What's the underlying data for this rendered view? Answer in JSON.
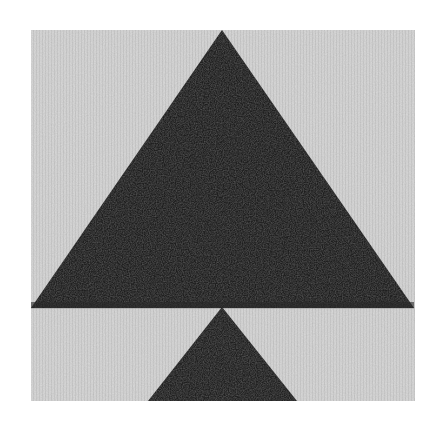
{
  "image": {
    "description": "Black-and-white photograph of a quilt block: a large dark fabric triangle on a light textured background, with a smaller dark triangle beneath it",
    "colors": {
      "page_background": "#ffffff",
      "fabric_light": "#d6d6d6",
      "fabric_light_speckle": "#b8b8b8",
      "fabric_dark": "#1e1e1e",
      "fabric_dark_speckle": "#3a3a3a"
    },
    "regions": {
      "fabric_panel": {
        "x": 31,
        "y": 30,
        "width": 384,
        "height": 371
      },
      "large_triangle": {
        "apex": [
          222,
          30
        ],
        "base_left": [
          31,
          308
        ],
        "base_right": [
          414,
          308
        ]
      },
      "small_triangle": {
        "apex": [
          222,
          307
        ],
        "base_left": [
          148,
          401
        ],
        "base_right": [
          297,
          401
        ]
      }
    }
  }
}
